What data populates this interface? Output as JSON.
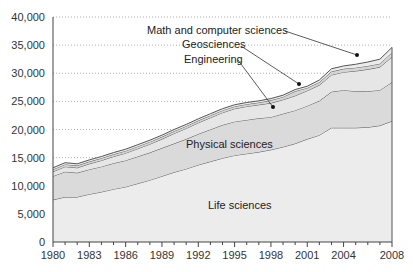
{
  "chart_data": {
    "type": "area",
    "stacked": true,
    "title": "",
    "xlabel": "",
    "ylabel": "",
    "ylim": [
      0,
      40000
    ],
    "xlim": [
      1980,
      2008
    ],
    "grid": true,
    "y_ticks": [
      0,
      5000,
      10000,
      15000,
      20000,
      25000,
      30000,
      35000,
      40000
    ],
    "y_tick_labels": [
      "0",
      "5,000",
      "10,000",
      "15,000",
      "20,000",
      "25,000",
      "30,000",
      "35,000",
      "40,000"
    ],
    "x_ticks": [
      1980,
      1983,
      1986,
      1989,
      1992,
      1995,
      1998,
      2001,
      2004,
      2008
    ],
    "x_tick_labels": [
      "1980",
      "1983",
      "1986",
      "1989",
      "1992",
      "1995",
      "1998",
      "2001",
      "2004",
      "2008"
    ],
    "x": [
      1980,
      1981,
      1982,
      1983,
      1984,
      1985,
      1986,
      1987,
      1988,
      1989,
      1990,
      1991,
      1992,
      1993,
      1994,
      1995,
      1996,
      1997,
      1998,
      1999,
      2000,
      2001,
      2002,
      2003,
      2004,
      2005,
      2006,
      2007,
      2008
    ],
    "series": [
      {
        "name": "Life sciences",
        "values": [
          7500,
          8000,
          8000,
          8500,
          8900,
          9400,
          9800,
          10400,
          11000,
          11700,
          12400,
          13000,
          13700,
          14300,
          14900,
          15400,
          15700,
          16000,
          16400,
          16900,
          17500,
          18300,
          19000,
          20300,
          20300,
          20300,
          20400,
          20700,
          21500
        ],
        "fill": "#ececec"
      },
      {
        "name": "Physical sciences",
        "values": [
          4200,
          4500,
          4300,
          4400,
          4500,
          4600,
          4700,
          4800,
          4900,
          5000,
          5100,
          5300,
          5500,
          5700,
          5900,
          6000,
          6000,
          6000,
          5800,
          5900,
          5900,
          5900,
          6100,
          6400,
          6700,
          6500,
          6400,
          6300,
          6900
        ],
        "fill": "#dadada"
      },
      {
        "name": "Engineering",
        "values": [
          800,
          900,
          900,
          1000,
          1100,
          1200,
          1300,
          1400,
          1500,
          1600,
          1800,
          1900,
          2000,
          2100,
          2200,
          2300,
          2400,
          2400,
          2500,
          2500,
          2600,
          2700,
          2800,
          3000,
          3200,
          3600,
          3900,
          4100,
          4500
        ],
        "fill": "#e6e6e6"
      },
      {
        "name": "Geosciences",
        "values": [
          400,
          400,
          400,
          400,
          400,
          400,
          400,
          400,
          400,
          400,
          400,
          400,
          400,
          400,
          400,
          400,
          400,
          400,
          500,
          500,
          800,
          500,
          500,
          600,
          600,
          600,
          600,
          600,
          800
        ],
        "fill": "#d4d4d4"
      },
      {
        "name": "Math and computer sciences",
        "values": [
          300,
          300,
          300,
          300,
          300,
          300,
          300,
          300,
          300,
          300,
          300,
          300,
          300,
          300,
          300,
          300,
          300,
          300,
          300,
          300,
          300,
          300,
          400,
          500,
          500,
          600,
          700,
          800,
          900
        ],
        "fill": "#ebebeb"
      }
    ],
    "annotations": [
      {
        "text": "Math and computer sciences",
        "series": "Math and computer sciences",
        "pointer": true
      },
      {
        "text": "Geosciences",
        "series": "Geosciences",
        "pointer": true
      },
      {
        "text": "Engineering",
        "series": "Engineering",
        "pointer": true
      },
      {
        "text": "Physical sciences",
        "series": "Physical sciences",
        "pointer": false
      },
      {
        "text": "Life sciences",
        "series": "Life sciences",
        "pointer": false
      }
    ],
    "legend": "none (inline labels)"
  },
  "labels": {
    "math": "Math and computer sciences",
    "geo": "Geosciences",
    "eng": "Engineering",
    "phys": "Physical sciences",
    "life": "Life sciences"
  }
}
